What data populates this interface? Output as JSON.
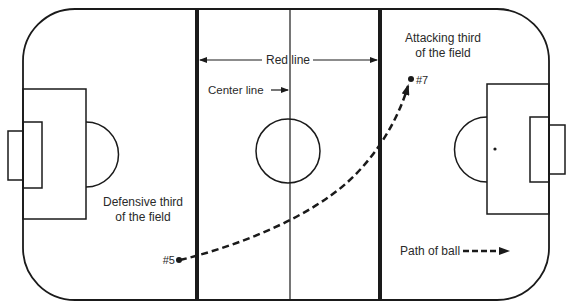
{
  "diagram": {
    "type": "soccer-field-zones",
    "colors": {
      "ink": "#1a1a1a",
      "background": "#ffffff",
      "label": "#2a2a2a"
    },
    "labels": {
      "red_line": "Red line",
      "center_line": "Center line",
      "attacking_line1": "Attacking third",
      "attacking_line2": "of the field",
      "defensive_line1": "Defensive third",
      "defensive_line2": "of the field",
      "player_from": "#5",
      "player_to": "#7",
      "legend_path": "Path of ball"
    }
  }
}
